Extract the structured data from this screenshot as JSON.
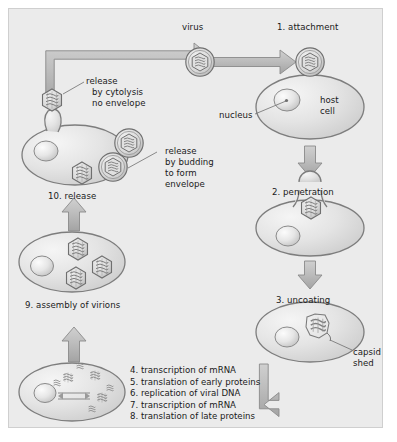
{
  "figure": {
    "background_color": "#ebebeb",
    "border_color": "#cfcfcf",
    "cell_fill": "#e2e2e2",
    "cell_stroke": "#8a8a8a",
    "arrow_fill": "#b9b9b9",
    "arrow_stroke": "#8a8a8a",
    "text_color": "#1a1a1a"
  },
  "labels": {
    "virus": "virus",
    "step1": "1. attachment",
    "host_cell_line1": "host",
    "host_cell_line2": "cell",
    "nucleus": "nucleus",
    "step2": "2. penetration",
    "step3": "3. uncoating",
    "capsid_line1": "capsid",
    "capsid_line2": "shed",
    "step9": "9. assembly of virions",
    "step10": "10. release",
    "release_cytolysis_line1": "release",
    "release_cytolysis_line2": "by cytolysis",
    "release_cytolysis_line3": "no envelope",
    "release_budding_line1": "release",
    "release_budding_line2": "by budding",
    "release_budding_line3": "to form",
    "release_budding_line4": "envelope"
  },
  "steps_list": [
    "4. transcription of mRNA",
    "5. translation of early proteins",
    "6. replication of viral DNA",
    "7. transcription of mRNA",
    "8. translation of late proteins"
  ],
  "icons": {
    "virus_particle": "virus-capsid-icon",
    "enveloped_virus": "enveloped-virus-icon",
    "nucleus": "nucleus-icon",
    "arrow_right": "arrow-right-icon",
    "arrow_down": "arrow-down-icon",
    "arrow_up": "arrow-up-icon",
    "arrow_elbow": "elbow-arrow-icon"
  }
}
